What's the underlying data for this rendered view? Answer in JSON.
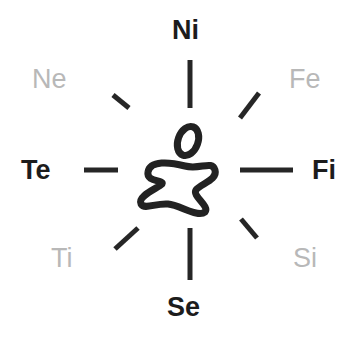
{
  "diagram": {
    "type": "radial-compass",
    "center_figure": "stick-figure-symbol",
    "colors": {
      "dark": "#1c1c1c",
      "light": "#b8b8b8",
      "background": "#ffffff"
    },
    "labels": {
      "n": {
        "text": "Ni",
        "style": "dark"
      },
      "ne": {
        "text": "Fe",
        "style": "light"
      },
      "e": {
        "text": "Fi",
        "style": "dark"
      },
      "se": {
        "text": "Si",
        "style": "light"
      },
      "s": {
        "text": "Se",
        "style": "dark"
      },
      "sw": {
        "text": "Ti",
        "style": "light"
      },
      "w": {
        "text": "Te",
        "style": "dark"
      },
      "nw": {
        "text": "Ne",
        "style": "light"
      }
    }
  }
}
